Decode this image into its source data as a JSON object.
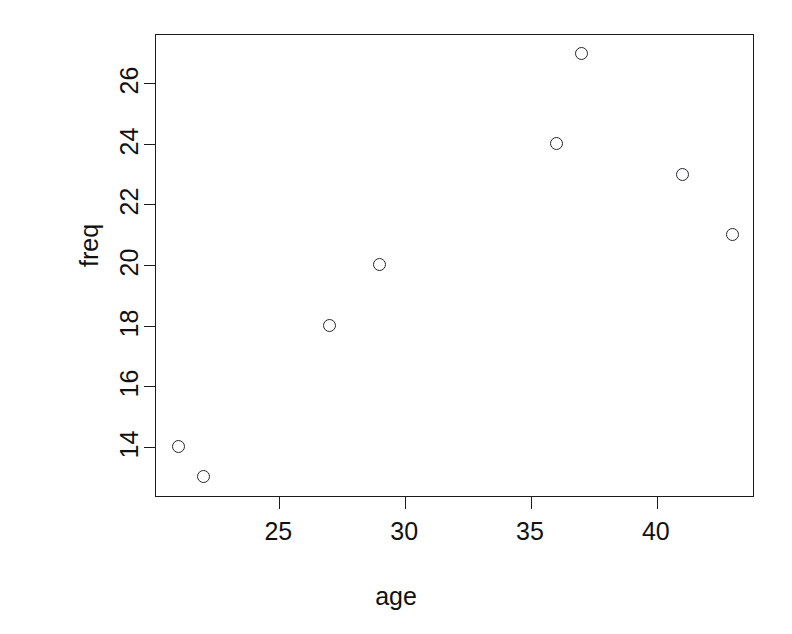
{
  "chart_data": {
    "type": "scatter",
    "title": "",
    "xlabel": "age",
    "ylabel": "freq",
    "x": [
      21,
      22,
      27,
      29,
      36,
      37,
      41,
      43
    ],
    "y": [
      14,
      13,
      18,
      20,
      24,
      27,
      23,
      21
    ],
    "points": [
      {
        "x": 21,
        "y": 14
      },
      {
        "x": 22,
        "y": 13
      },
      {
        "x": 27,
        "y": 18
      },
      {
        "x": 29,
        "y": 20
      },
      {
        "x": 36,
        "y": 24
      },
      {
        "x": 37,
        "y": 27
      },
      {
        "x": 41,
        "y": 23
      },
      {
        "x": 43,
        "y": 21
      }
    ],
    "xlim": [
      20.1,
      43.9
    ],
    "ylim": [
      12.3,
      27.6
    ],
    "xticks": [
      25,
      30,
      35,
      40
    ],
    "yticks": [
      14,
      16,
      18,
      20,
      22,
      24,
      26
    ],
    "xtick_labels": [
      "25",
      "30",
      "35",
      "40"
    ],
    "ytick_labels": [
      "14",
      "16",
      "18",
      "20",
      "22",
      "24",
      "26"
    ],
    "grid": false,
    "legend": null,
    "marker": "open-circle",
    "marker_color": "#26262b",
    "axis_color": "#1c1c1c",
    "background": "#ffffff"
  }
}
